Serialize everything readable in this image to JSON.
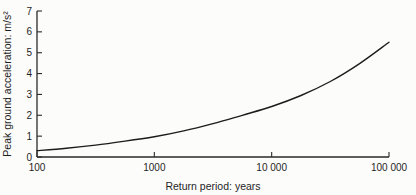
{
  "chart_data": {
    "type": "line",
    "title": "",
    "xlabel": "Return period: years",
    "ylabel": "Peak ground acceleration: m/s²",
    "x_scale": "log",
    "xlim": [
      100,
      100000
    ],
    "ylim": [
      0,
      7
    ],
    "grid": false,
    "legend": false,
    "x_ticks": [
      {
        "value": 100,
        "label": "100"
      },
      {
        "value": 1000,
        "label": "1000"
      },
      {
        "value": 10000,
        "label": "10 000"
      },
      {
        "value": 100000,
        "label": "100 000"
      }
    ],
    "y_ticks": [
      0,
      1,
      2,
      3,
      4,
      5,
      6,
      7
    ],
    "series": [
      {
        "name": "seismic-hazard-curve",
        "color": "#1c1c1c",
        "points": [
          [
            100,
            0.3
          ],
          [
            178,
            0.42
          ],
          [
            316,
            0.57
          ],
          [
            562,
            0.76
          ],
          [
            1000,
            0.97
          ],
          [
            1780,
            1.25
          ],
          [
            3160,
            1.6
          ],
          [
            5620,
            2.0
          ],
          [
            10000,
            2.42
          ],
          [
            17800,
            2.95
          ],
          [
            31600,
            3.62
          ],
          [
            56200,
            4.48
          ],
          [
            100000,
            5.5
          ]
        ]
      }
    ]
  },
  "colors": {
    "background": "#fcfcfb",
    "axis": "#2a2a2a",
    "text": "#1f1f1f"
  }
}
